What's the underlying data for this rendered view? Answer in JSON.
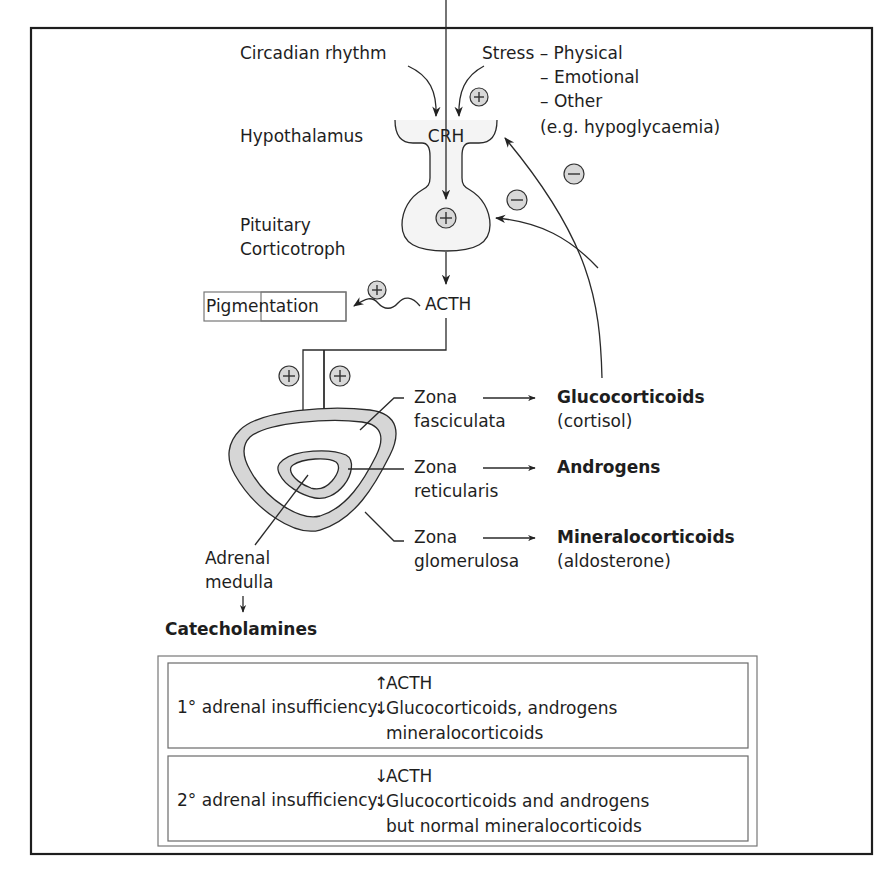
{
  "inputs": {
    "circadian": "Circadian rhythm",
    "stress_head": "Stress – Physical",
    "stress_emotional": "– Emotional",
    "stress_other": "– Other",
    "stress_example": "(e.g. hypoglycaemia)"
  },
  "structures": {
    "hypothalamus": "Hypothalamus",
    "crh": "CRH",
    "pituitary_line1": "Pituitary",
    "pituitary_line2": "Corticotroph",
    "acth": "ACTH",
    "pigmentation": "Pigmentation"
  },
  "zones": [
    {
      "line1": "Zona",
      "line2": "fasciculata",
      "product": "Glucocorticoids",
      "product_note": "(cortisol)"
    },
    {
      "line1": "Zona",
      "line2": "reticularis",
      "product": "Androgens",
      "product_note": ""
    },
    {
      "line1": "Zona",
      "line2": "glomerulosa",
      "product": "Mineralocorticoids",
      "product_note": "(aldosterone)"
    }
  ],
  "medulla": {
    "line1": "Adrenal",
    "line2": "medulla",
    "arrow": "↓",
    "product": "Catecholamines"
  },
  "signs": {
    "plus": "+",
    "minus": "−"
  },
  "insufficiency": [
    {
      "label": "1° adrenal insufficiency:",
      "lines": [
        {
          "arrow": "↑",
          "text": "ACTH"
        },
        {
          "arrow": "↓",
          "text": "Glucocorticoids, androgens"
        },
        {
          "arrow": "",
          "text": "mineralocorticoids"
        }
      ]
    },
    {
      "label": "2° adrenal insufficiency:",
      "lines": [
        {
          "arrow": "↓",
          "text": "ACTH"
        },
        {
          "arrow": "↓",
          "text": "Glucocorticoids and androgens"
        },
        {
          "arrow": "",
          "text": "but normal mineralocorticoids"
        }
      ]
    }
  ],
  "colors": {
    "frame": "#1e1e1e",
    "zone_fill": "#d6d6d6",
    "sign_fill": "#d8d8d8"
  }
}
